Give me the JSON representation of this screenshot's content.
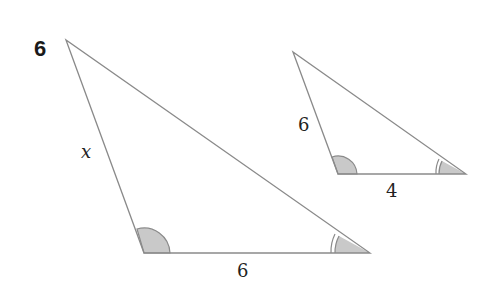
{
  "question_number": "6",
  "colors": {
    "line": "#8a8a8a",
    "angle_fill": "#c9c9c9",
    "text": "#222222"
  },
  "large_triangle": {
    "side_left_label": "x",
    "side_bottom_label": "6",
    "angle_marks": [
      "single-arc bottom-left",
      "double-arc bottom-right"
    ]
  },
  "small_triangle": {
    "side_left_label": "6",
    "side_bottom_label": "4",
    "angle_marks": [
      "single-arc bottom-left",
      "double-arc bottom-right"
    ]
  }
}
